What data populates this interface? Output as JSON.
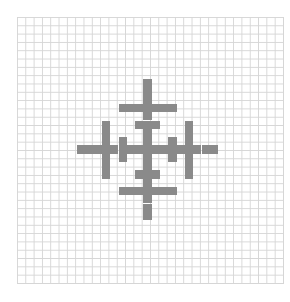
{
  "canvas": {
    "grid_cells": 32,
    "cell_size_px": 8.31,
    "grid_line_color": "#d6d6d6",
    "background_color": "#ffffff"
  },
  "pattern": {
    "name": "symmetric-cross-glyph",
    "fill_color": "#8a8a8a",
    "size": 17,
    "cell_px": 8.3,
    "segments": [
      {
        "label": "vertical-axis",
        "orientation": "v",
        "col": 8,
        "from": 0,
        "to": 16
      },
      {
        "label": "horizontal-axis",
        "orientation": "h",
        "row": 8,
        "from": 0,
        "to": 16
      },
      {
        "label": "upper-crossbar",
        "orientation": "h",
        "row": 3,
        "from": 5,
        "to": 11
      },
      {
        "label": "lower-crossbar",
        "orientation": "h",
        "row": 13,
        "from": 5,
        "to": 11
      },
      {
        "label": "upper-small-bar",
        "orientation": "h",
        "row": 5,
        "from": 7,
        "to": 9
      },
      {
        "label": "lower-small-bar",
        "orientation": "h",
        "row": 11,
        "from": 7,
        "to": 9
      },
      {
        "label": "left-tall-bar",
        "orientation": "v",
        "col": 3,
        "from": 5,
        "to": 11
      },
      {
        "label": "right-tall-bar",
        "orientation": "v",
        "col": 13,
        "from": 5,
        "to": 11
      },
      {
        "label": "left-short-bar",
        "orientation": "v",
        "col": 5,
        "from": 7,
        "to": 9
      },
      {
        "label": "right-short-bar",
        "orientation": "v",
        "col": 11,
        "from": 7,
        "to": 9
      }
    ]
  }
}
